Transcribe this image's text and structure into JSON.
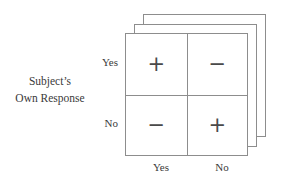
{
  "figure": {
    "axis_title": {
      "line1": "Subject’s",
      "line2": "Own Response"
    },
    "row_header_labels": [
      "Yes",
      "No"
    ],
    "column_header_labels": [
      "Yes",
      "No"
    ],
    "stack_layers": 3,
    "line_color": "#8d8d8d",
    "text_color": "#3a3a3a",
    "symbol_color": "#4a4a4a",
    "background_color": "#ffffff"
  },
  "chart_data": {
    "type": "table",
    "title": "",
    "xlabel": "",
    "ylabel": "Subject’s Own Response",
    "categories": [
      "Yes",
      "No"
    ],
    "row_categories": [
      "Yes",
      "No"
    ],
    "column_categories": [
      "Yes",
      "No"
    ],
    "cells": [
      {
        "row": "Yes",
        "column": "Yes",
        "value": "+"
      },
      {
        "row": "Yes",
        "column": "No",
        "value": "−"
      },
      {
        "row": "No",
        "column": "Yes",
        "value": "−"
      },
      {
        "row": "No",
        "column": "No",
        "value": "+"
      }
    ],
    "grid": true,
    "legend": "none"
  }
}
